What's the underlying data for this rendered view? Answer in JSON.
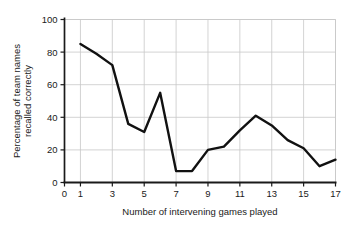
{
  "chart_data": {
    "type": "line",
    "title": "",
    "xlabel": "Number of intervening games played",
    "ylabel": "Percentage of team names recalled correctly",
    "ylabel_lines": [
      "Percentage of team names",
      "recalled correctly"
    ],
    "x": [
      1,
      2,
      3,
      4,
      5,
      6,
      7,
      8,
      9,
      10,
      11,
      12,
      13,
      14,
      15,
      16,
      17
    ],
    "values": [
      85,
      79,
      72,
      36,
      31,
      55,
      7,
      7,
      20,
      22,
      32,
      41,
      35,
      26,
      21,
      10,
      14
    ],
    "xlim": [
      0,
      17
    ],
    "ylim": [
      0,
      100
    ],
    "xticks": [
      0,
      1,
      3,
      5,
      7,
      9,
      11,
      13,
      15,
      17
    ],
    "xtick_labels": [
      "0",
      "1",
      "3",
      "5",
      "7",
      "9",
      "11",
      "13",
      "15",
      "17"
    ],
    "yticks": [
      0,
      20,
      40,
      60,
      80,
      100
    ],
    "ytick_labels": [
      "0",
      "20",
      "40",
      "60",
      "80",
      "100"
    ],
    "grid": true,
    "grid_color": "#c8c8c8",
    "legend": false,
    "line_color": "#111111",
    "line_width": 2.4,
    "axis_color": "#1a1a1a",
    "background": "#ffffff"
  }
}
